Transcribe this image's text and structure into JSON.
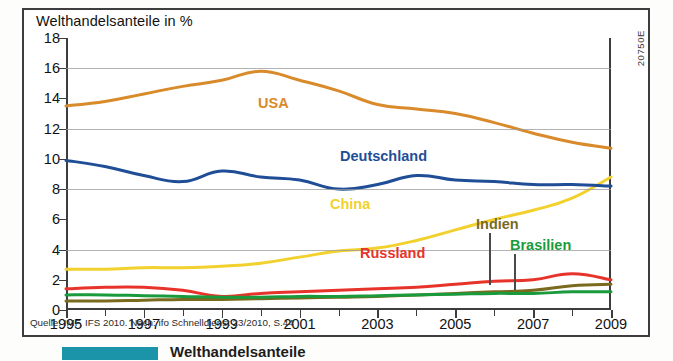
{
  "chart_title": "Welthandelsanteile in %",
  "catalog_code": "20750E",
  "source_note": "Quelle: IMF, IFS 2010. Nach: ifo Schnelldienst 23/2010, S.44",
  "caption_strip": {
    "text": "Welthandelsanteile"
  },
  "axes": {
    "y_ticks": [
      "18",
      "16",
      "14",
      "12",
      "10",
      "8",
      "6",
      "4",
      "2",
      "0"
    ],
    "x_ticks": [
      "1995",
      "1997",
      "1999",
      "2001",
      "2003",
      "2005",
      "2007",
      "2009"
    ]
  },
  "colors": {
    "usa": "#D98A2B",
    "deutschland": "#1F4E96",
    "china": "#F2D12E",
    "russland": "#E8332A",
    "indien": "#7A6A1E",
    "brasilien": "#199A3C",
    "frame": "#3d3d3d",
    "grid": "#9a9a9a",
    "caption_bar": "#1b93a8"
  },
  "series_labels": {
    "usa": "USA",
    "deutschland": "Deutschland",
    "china": "China",
    "russland": "Russland",
    "indien": "Indien",
    "brasilien": "Brasilien"
  },
  "chart_data": {
    "type": "line",
    "title": "Welthandelsanteile in %",
    "xlabel": "",
    "ylabel": "%",
    "xlim": [
      1995,
      2009
    ],
    "ylim": [
      0,
      18
    ],
    "y_ticks": [
      0,
      2,
      4,
      6,
      8,
      10,
      12,
      14,
      16,
      18
    ],
    "gridlines_at": [
      4,
      8,
      12,
      16
    ],
    "x": [
      1995,
      1996,
      1997,
      1998,
      1999,
      2000,
      2001,
      2002,
      2003,
      2004,
      2005,
      2006,
      2007,
      2008,
      2009
    ],
    "legend": "inline-labels",
    "series": [
      {
        "name": "USA",
        "color": "#D98A2B",
        "values": [
          13.5,
          13.8,
          14.3,
          14.8,
          15.2,
          15.8,
          15.2,
          14.5,
          13.6,
          13.3,
          13.0,
          12.4,
          11.7,
          11.1,
          10.7
        ]
      },
      {
        "name": "Deutschland",
        "color": "#1F4E96",
        "values": [
          9.9,
          9.5,
          8.9,
          8.5,
          9.2,
          8.8,
          8.6,
          8.0,
          8.3,
          8.9,
          8.6,
          8.5,
          8.3,
          8.3,
          8.2
        ]
      },
      {
        "name": "China",
        "color": "#F2D12E",
        "values": [
          2.7,
          2.7,
          2.8,
          2.8,
          2.9,
          3.1,
          3.5,
          3.9,
          4.1,
          4.6,
          5.3,
          6.0,
          6.6,
          7.4,
          8.8
        ]
      },
      {
        "name": "Russland",
        "color": "#E8332A",
        "values": [
          1.4,
          1.5,
          1.5,
          1.3,
          0.9,
          1.1,
          1.2,
          1.3,
          1.4,
          1.5,
          1.7,
          1.9,
          2.0,
          2.4,
          2.0
        ]
      },
      {
        "name": "Indien",
        "color": "#7A6A1E",
        "values": [
          0.6,
          0.6,
          0.65,
          0.7,
          0.7,
          0.75,
          0.8,
          0.85,
          0.9,
          1.0,
          1.1,
          1.2,
          1.3,
          1.6,
          1.7
        ]
      },
      {
        "name": "Brasilien",
        "color": "#199A3C",
        "values": [
          1.0,
          1.0,
          0.95,
          0.9,
          0.85,
          0.85,
          0.9,
          0.9,
          0.95,
          1.0,
          1.05,
          1.1,
          1.1,
          1.2,
          1.2
        ]
      }
    ]
  }
}
